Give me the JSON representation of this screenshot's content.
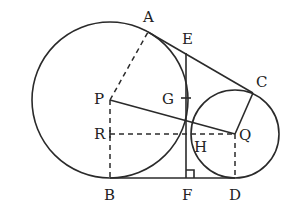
{
  "diagram": {
    "type": "geometry",
    "colors": {
      "stroke": "#2a2a2a",
      "label": "#222222",
      "background": "#ffffff"
    },
    "points": {
      "A": {
        "label": "A",
        "x": 148,
        "y": 32
      },
      "B": {
        "label": "B",
        "x": 110,
        "y": 178
      },
      "C": {
        "label": "C",
        "x": 253,
        "y": 93
      },
      "D": {
        "label": "D",
        "x": 235,
        "y": 178
      },
      "E": {
        "label": "E",
        "x": 186,
        "y": 53
      },
      "F": {
        "label": "F",
        "x": 186,
        "y": 178
      },
      "G": {
        "label": "G",
        "x": 186,
        "y": 98
      },
      "H": {
        "label": "H",
        "x": 186,
        "y": 134
      },
      "P": {
        "label": "P",
        "x": 110,
        "y": 100
      },
      "Q": {
        "label": "Q",
        "x": 235,
        "y": 134
      },
      "R": {
        "label": "R",
        "x": 110,
        "y": 134
      }
    },
    "circles": [
      {
        "name": "circle-P",
        "center": "P",
        "r": 78
      },
      {
        "name": "circle-Q",
        "center": "Q",
        "r": 44
      }
    ],
    "labels": {
      "A": "A",
      "B": "B",
      "C": "C",
      "D": "D",
      "E": "E",
      "F": "F",
      "G": "G",
      "H": "H",
      "P": "P",
      "Q": "Q",
      "R": "R"
    },
    "right_angle_marker_at": "F"
  }
}
